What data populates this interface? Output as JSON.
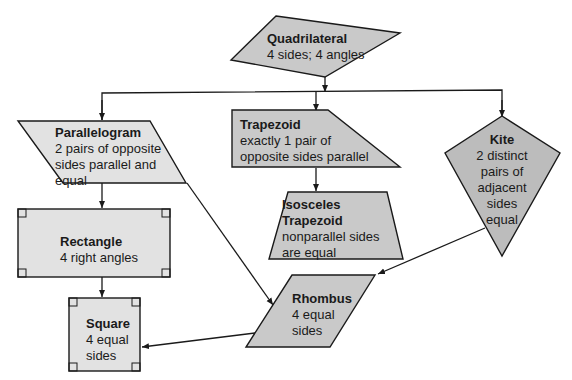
{
  "colors": {
    "fill_medium": "#c9c9c9",
    "fill_dark": "#bcbcbc",
    "fill_light": "#e2e2e2",
    "stroke": "#1a1a1a",
    "text": "#1a1a1a"
  },
  "nodes": {
    "quadrilateral": {
      "title": "Quadrilateral",
      "desc": "4 sides; 4 angles"
    },
    "parallelogram": {
      "title": "Parallelogram",
      "desc": "2 pairs of opposite\nsides parallel and\nequal"
    },
    "trapezoid": {
      "title": "Trapezoid",
      "desc": "exactly 1 pair of\nopposite sides parallel"
    },
    "kite": {
      "title": "Kite",
      "desc": "2 distinct\npairs of\nadjacent\nsides\nequal"
    },
    "isosceles_trapezoid": {
      "title": "Isosceles\nTrapezoid",
      "desc": "nonparallel sides\nare equal"
    },
    "rectangle": {
      "title": "Rectangle",
      "desc": "4 right angles"
    },
    "rhombus": {
      "title": "Rhombus",
      "desc": "4 equal\nsides"
    },
    "square": {
      "title": "Square",
      "desc": "4 equal\nsides"
    }
  },
  "edges": [
    {
      "from": "Quadrilateral",
      "to": "Parallelogram"
    },
    {
      "from": "Quadrilateral",
      "to": "Trapezoid"
    },
    {
      "from": "Quadrilateral",
      "to": "Kite"
    },
    {
      "from": "Trapezoid",
      "to": "Isosceles Trapezoid"
    },
    {
      "from": "Parallelogram",
      "to": "Rectangle"
    },
    {
      "from": "Parallelogram",
      "to": "Rhombus"
    },
    {
      "from": "Kite",
      "to": "Rhombus"
    },
    {
      "from": "Rectangle",
      "to": "Square"
    },
    {
      "from": "Rhombus",
      "to": "Square"
    }
  ]
}
